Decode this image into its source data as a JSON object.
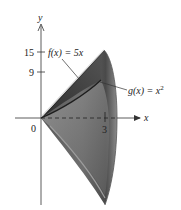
{
  "figure": {
    "type": "solid-of-revolution",
    "axes": {
      "x_label": "x",
      "y_label": "y",
      "origin_label": "0",
      "x_ticks": [
        "3"
      ],
      "y_ticks": [
        "15",
        "9"
      ]
    },
    "curves": {
      "f_label": "f(x) = 5x",
      "g_label": "g(x) = x",
      "g_exponent": "2"
    },
    "colors": {
      "solid_dark": "#3a3a3a",
      "solid_mid": "#6e6e6e",
      "solid_light": "#a8a8a8",
      "axis": "#333333"
    }
  }
}
